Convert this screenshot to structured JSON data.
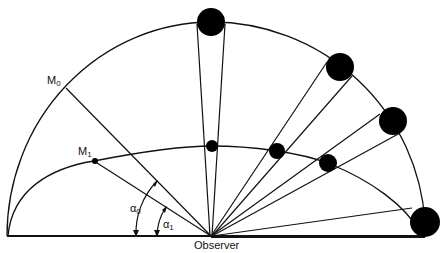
{
  "diagram": {
    "labels": {
      "observer": "Observer",
      "m0": "M",
      "m0_sub": "0",
      "m1": "M",
      "m1_sub": "1",
      "alpha0": "α",
      "alpha0_sub": "0",
      "alpha1": "α",
      "alpha1_sub": "1"
    },
    "colors": {
      "line": "#111111",
      "fill": "#000000",
      "background": "#ffffff"
    },
    "geometry": {
      "observer": [
        211,
        236
      ],
      "outer_arc": "semicircle radius ~204 centered at observer",
      "inner_arc": "flattened dome through M1 and inner balls",
      "outer_balls": [
        {
          "cx": 211,
          "cy": 22,
          "r": 14
        },
        {
          "cx": 340,
          "cy": 67,
          "r": 14
        },
        {
          "cx": 393,
          "cy": 121,
          "r": 14
        },
        {
          "cx": 425,
          "cy": 222,
          "r": 15
        }
      ],
      "inner_balls": [
        {
          "cx": 212,
          "cy": 146,
          "r": 6
        },
        {
          "cx": 277,
          "cy": 151,
          "r": 8
        },
        {
          "cx": 328,
          "cy": 163,
          "r": 9
        }
      ],
      "points": {
        "M0": [
          66,
          88
        ],
        "M1": [
          94,
          161
        ]
      }
    }
  }
}
